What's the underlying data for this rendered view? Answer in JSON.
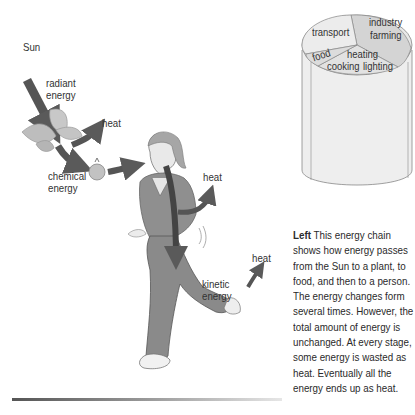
{
  "diagram": {
    "labels": {
      "sun": "Sun",
      "radiant_line1": "radiant",
      "radiant_line2": "energy",
      "heat_plant": "heat",
      "chemical_line1": "chemical",
      "chemical_line2": "energy",
      "heat_body": "heat",
      "heat_kinetic": "heat",
      "kinetic_line1": "kinetic",
      "kinetic_line2": "energy"
    },
    "icons": [
      "plant-leaf-icon",
      "fruit-icon",
      "runner-figure",
      "energy-arrow"
    ]
  },
  "cylinder": {
    "segments": [
      {
        "line1": "transport",
        "line2": ""
      },
      {
        "line1": "industry",
        "line2": "farming"
      },
      {
        "line1": "food",
        "line2": ""
      },
      {
        "line1": "heating",
        "line2": ""
      },
      {
        "line1": "cooking",
        "line2": "lighting"
      }
    ]
  },
  "caption": {
    "lead": "Left",
    "text": " This energy chain shows how energy passes from the Sun to a plant, to food, and then to a person. The energy changes form several times. However, the total amount of energy is unchanged. At every stage, some energy is wasted as heat. Eventually all the energy ends up as heat."
  }
}
